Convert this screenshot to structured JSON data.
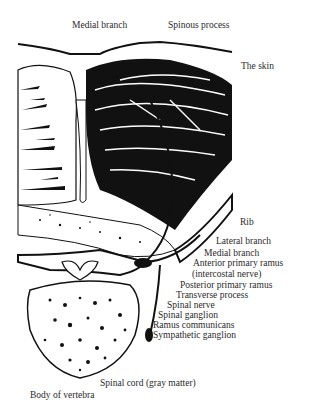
{
  "figure": {
    "labels": {
      "medial_branch_top": "Medial branch",
      "spinous_process": "Spinous process",
      "the_skin": "The skin",
      "rib": "Rib",
      "lateral_branch": "Lateral branch",
      "medial_branch": "Medial branch",
      "anterior_primary_ramus": "Anterior primary ramus",
      "intercostal_nerve": "(intercostal nerve)",
      "posterior_primary_ramus": "Posterior primary ramus",
      "transverse_process": "Transverse process",
      "spinal_nerve": "Spinal nerve",
      "spinal_ganglion": "Spinal ganglion",
      "ramus_communicans": "Ramus communicans",
      "sympathetic_ganglion": "Sympathetic ganglion",
      "spinal_cord": "Spinal cord (gray matter)",
      "body_of_vertebra": "Body of vertebra"
    }
  }
}
